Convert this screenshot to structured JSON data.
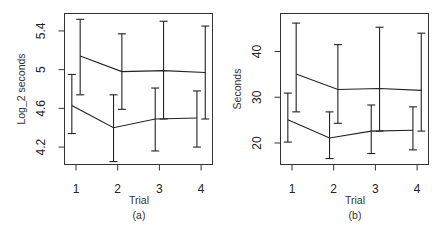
{
  "chart_data": [
    {
      "type": "line",
      "panel": "(a)",
      "title": "",
      "xlabel": "Trial",
      "ylabel": "Log_2 seconds",
      "caption": "(a)",
      "x": [
        1,
        2,
        3,
        4
      ],
      "x_ticks": [
        "1",
        "2",
        "3",
        "4"
      ],
      "y_ticks": [
        4.2,
        4.6,
        5.0,
        5.4
      ],
      "y_tick_labels": [
        "4.2",
        "4.6",
        "5",
        "5.4"
      ],
      "ylim": [
        4.02,
        5.58
      ],
      "grid": false,
      "legend": null,
      "series": [
        {
          "name": "lower",
          "x_offset": -0.1,
          "values": [
            4.63,
            4.4,
            4.49,
            4.5
          ],
          "upper": [
            4.95,
            4.74,
            4.81,
            4.78
          ],
          "lower": [
            4.34,
            4.05,
            4.16,
            4.2
          ]
        },
        {
          "name": "upper",
          "x_offset": 0.1,
          "values": [
            5.14,
            4.98,
            4.99,
            4.97
          ],
          "upper": [
            5.52,
            5.37,
            5.5,
            5.45
          ],
          "lower": [
            4.74,
            4.59,
            4.49,
            4.49
          ]
        }
      ]
    },
    {
      "type": "line",
      "panel": "(b)",
      "title": "",
      "xlabel": "Trial",
      "ylabel": "Seconds",
      "caption": "(b)",
      "x": [
        1,
        2,
        3,
        4
      ],
      "x_ticks": [
        "1",
        "2",
        "3",
        "4"
      ],
      "y_ticks": [
        20,
        30,
        40
      ],
      "y_tick_labels": [
        "20",
        "30",
        "40"
      ],
      "ylim": [
        15.3,
        48.3
      ],
      "grid": false,
      "legend": null,
      "series": [
        {
          "name": "lower",
          "x_offset": -0.1,
          "values": [
            25.1,
            21.1,
            22.6,
            22.8
          ],
          "upper": [
            30.9,
            26.8,
            28.3,
            27.9
          ],
          "lower": [
            20.2,
            16.6,
            17.7,
            18.5
          ]
        },
        {
          "name": "upper",
          "x_offset": 0.1,
          "values": [
            35.1,
            31.7,
            31.9,
            31.5
          ],
          "upper": [
            46.2,
            41.5,
            45.3,
            44.0
          ],
          "lower": [
            26.8,
            24.3,
            22.6,
            22.6
          ]
        }
      ]
    }
  ]
}
